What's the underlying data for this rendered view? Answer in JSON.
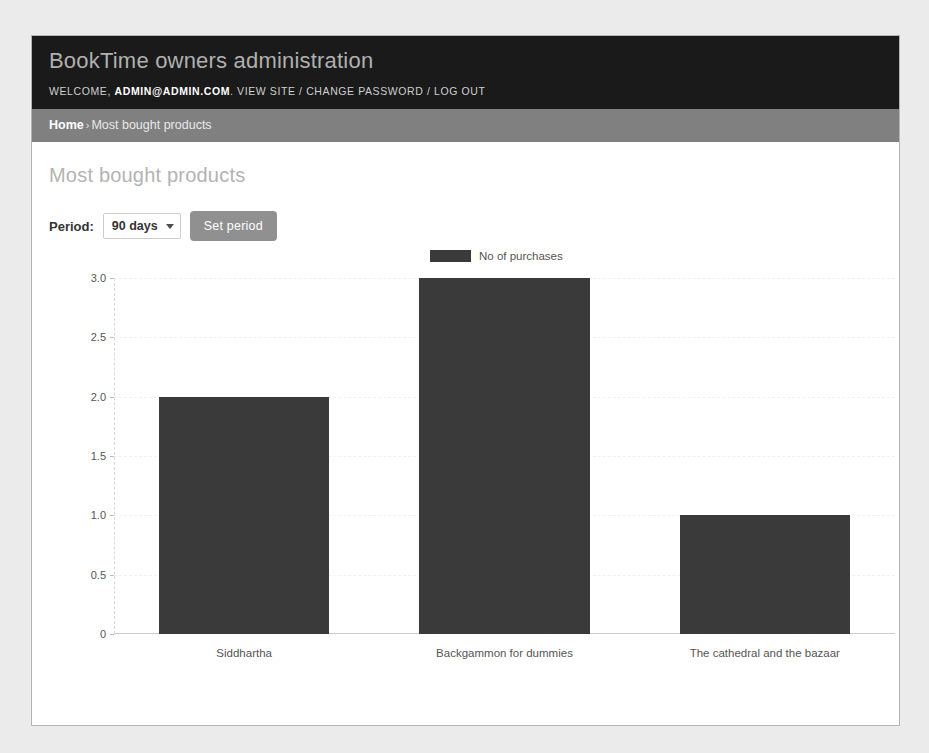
{
  "header": {
    "site_name": "BookTime owners administration",
    "welcome_label": "WELCOME,",
    "user_email": "ADMIN@ADMIN.COM",
    "separator_after_email": ".",
    "view_site_label": "VIEW SITE",
    "divider_1": "/",
    "change_password_label": "CHANGE PASSWORD",
    "divider_2": "/",
    "log_out_label": "LOG OUT"
  },
  "breadcrumbs": {
    "home_label": "Home",
    "separator": "›",
    "current_label": "Most bought products"
  },
  "content": {
    "page_title": "Most bought products",
    "period_label": "Period:",
    "period_selected": "90 days",
    "period_options": [
      "90 days"
    ],
    "set_period_label": "Set period"
  },
  "colors": {
    "header_bg": "#1a1a1a",
    "breadcrumb_bg": "#808080",
    "bar_fill": "#3a3a3a",
    "button_bg": "#909090",
    "page_bg": "#ebebeb",
    "panel_bg": "#ffffff"
  },
  "chart_data": {
    "type": "bar",
    "title": "",
    "xlabel": "",
    "ylabel": "",
    "categories": [
      "Siddhartha",
      "Backgammon for dummies",
      "The cathedral and the bazaar"
    ],
    "values": [
      2,
      3,
      1
    ],
    "series": [
      {
        "name": "No of purchases",
        "values": [
          2,
          3,
          1
        ],
        "color": "#3a3a3a"
      }
    ],
    "legend": [
      "No of purchases"
    ],
    "legend_position": "top-center",
    "ylim": [
      0,
      3
    ],
    "yticks": [
      0,
      0.5,
      1.0,
      1.5,
      2.0,
      2.5,
      3.0
    ],
    "ytick_labels": [
      "0",
      "0.5",
      "1.0",
      "1.5",
      "2.0",
      "2.5",
      "3.0"
    ],
    "grid": true
  }
}
